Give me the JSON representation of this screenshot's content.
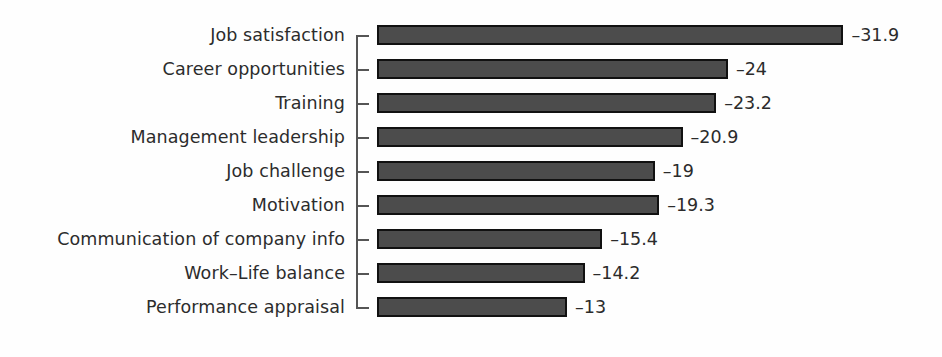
{
  "chart_data": {
    "type": "bar",
    "orientation": "horizontal",
    "title": "",
    "subtitle": "",
    "xlabel": "",
    "ylabel": "",
    "grid": false,
    "legend": null,
    "axis_style": "bracket-spine-with-ticks",
    "value_label_position": "outside-end",
    "negative_sign_glyph": "–",
    "xlim": [
      -35,
      0
    ],
    "categories": [
      "Job satisfaction",
      "Career opportunities",
      "Training",
      "Management leadership",
      "Job challenge",
      "Motivation",
      "Communication of company info",
      "Work–Life balance",
      "Performance appraisal"
    ],
    "values": [
      -31.9,
      -24,
      -23.2,
      -20.9,
      -19,
      -19.3,
      -15.4,
      -14.2,
      -13
    ],
    "value_labels": [
      "–31.9",
      "–24",
      "–23.2",
      "–20.9",
      "–19",
      "–19.3",
      "–15.4",
      "–14.2",
      "–13"
    ],
    "bars": [
      {
        "category": "Job satisfaction",
        "value": -31.9,
        "label": "–31.9"
      },
      {
        "category": "Career opportunities",
        "value": -24,
        "label": "–24"
      },
      {
        "category": "Training",
        "value": -23.2,
        "label": "–23.2"
      },
      {
        "category": "Management leadership",
        "value": -20.9,
        "label": "–20.9"
      },
      {
        "category": "Job challenge",
        "value": -19,
        "label": "–19"
      },
      {
        "category": "Motivation",
        "value": -19.3,
        "label": "–19.3"
      },
      {
        "category": "Communication of company info",
        "value": -15.4,
        "label": "–15.4"
      },
      {
        "category": "Work–Life balance",
        "value": -14.2,
        "label": "–14.2"
      },
      {
        "category": "Performance appraisal",
        "value": -13,
        "label": "–13"
      }
    ],
    "colors": {
      "bar_fill": "#4c4c4c",
      "bar_border": "#111111",
      "axis": "#555555",
      "text": "#2c2c2c",
      "background": "#fefefe"
    }
  }
}
